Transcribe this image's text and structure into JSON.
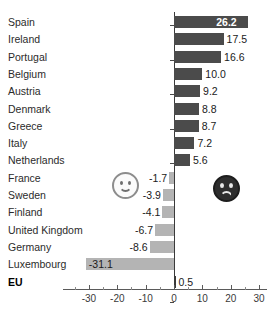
{
  "chart_data": {
    "type": "bar",
    "orientation": "horizontal",
    "title": "",
    "xlabel": "",
    "ylabel": "",
    "xlim": [
      -35,
      31
    ],
    "grid": false,
    "legend": null,
    "categories": [
      "Spain",
      "Ireland",
      "Portugal",
      "Belgium",
      "Austria",
      "Denmark",
      "Greece",
      "Italy",
      "Netherlands",
      "France",
      "Sweden",
      "Finland",
      "United Kingdom",
      "Germany",
      "Luxembourg",
      "EU"
    ],
    "values": [
      26.2,
      17.5,
      16.6,
      10.0,
      9.2,
      8.8,
      8.7,
      7.2,
      5.6,
      -1.7,
      -3.9,
      -4.1,
      -6.7,
      -8.6,
      -31.1,
      0.5
    ],
    "value_labels": [
      "26.2",
      "17.5",
      "16.6",
      "10.0",
      "9.2",
      "8.8",
      "8.7",
      "7.2",
      "5.6",
      "-1.7",
      "-3.9",
      "-4.1",
      "-6.7",
      "-8.6",
      "-31.1",
      "0.5"
    ],
    "xticks": [
      -30,
      -20,
      -10,
      0,
      10,
      20,
      30
    ],
    "xtick_labels": [
      "-30",
      "-20",
      "-10",
      "0",
      "10",
      "20",
      "30"
    ],
    "colors": {
      "positive_bar": "#4b4b4b",
      "negative_bar": "#b4b4b4",
      "total_bar": "#3a3a3a",
      "axis": "#3a3a3a",
      "label_text": "#2b2b2b",
      "inside_label_text": "#ffffff"
    },
    "total_row": "EU",
    "annotations": [
      {
        "name": "happy-face",
        "glyph": "smiley-happy-icon",
        "meaning": "positive"
      },
      {
        "name": "sad-face",
        "glyph": "smiley-sad-icon",
        "meaning": "negative"
      }
    ]
  },
  "rows": [
    {
      "label": "Spain",
      "value_label": "26.2",
      "negative": false,
      "inside": true
    },
    {
      "label": "Ireland",
      "value_label": "17.5",
      "negative": false,
      "inside": false
    },
    {
      "label": "Portugal",
      "value_label": "16.6",
      "negative": false,
      "inside": false
    },
    {
      "label": "Belgium",
      "value_label": "10.0",
      "negative": false,
      "inside": false
    },
    {
      "label": "Austria",
      "value_label": "9.2",
      "negative": false,
      "inside": false
    },
    {
      "label": "Denmark",
      "value_label": "8.8",
      "negative": false,
      "inside": false
    },
    {
      "label": "Greece",
      "value_label": "8.7",
      "negative": false,
      "inside": false
    },
    {
      "label": "Italy",
      "value_label": "7.2",
      "negative": false,
      "inside": false
    },
    {
      "label": "Netherlands",
      "value_label": "5.6",
      "negative": false,
      "inside": false
    },
    {
      "label": "France",
      "value_label": "-1.7",
      "negative": true,
      "inside": false
    },
    {
      "label": "Sweden",
      "value_label": "-3.9",
      "negative": true,
      "inside": false
    },
    {
      "label": "Finland",
      "value_label": "-4.1",
      "negative": true,
      "inside": false
    },
    {
      "label": "United Kingdom",
      "value_label": "-6.7",
      "negative": true,
      "inside": false
    },
    {
      "label": "Germany",
      "value_label": "-8.6",
      "negative": true,
      "inside": false
    },
    {
      "label": "Luxembourg",
      "value_label": "-31.1",
      "negative": true,
      "inside": true
    },
    {
      "label": "EU",
      "value_label": "0.5",
      "negative": false,
      "inside": false
    }
  ]
}
